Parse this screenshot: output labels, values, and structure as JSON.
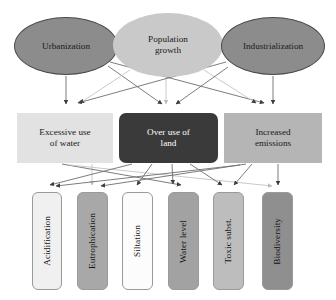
{
  "diagram": {
    "type": "causal-flow-diagram",
    "title": "",
    "rows": {
      "drivers_label": "Drivers",
      "pressures_label": "Pressures",
      "impacts_label": "Impacts"
    },
    "drivers": [
      {
        "id": "urbanization",
        "label": "Urbanization",
        "shape": "ellipse",
        "fill": "#8c8c8c",
        "stroke": "#4a4a4a",
        "x": 14,
        "y": 17,
        "w": 104,
        "h": 58
      },
      {
        "id": "population-growth",
        "label": "Population growth",
        "label_line1": "Population",
        "label_line2": "growth",
        "shape": "ellipse",
        "fill": "#c9c9c9",
        "stroke": "none",
        "x": 113,
        "y": 13,
        "w": 110,
        "h": 64
      },
      {
        "id": "industrialization",
        "label": "Industrialization",
        "shape": "ellipse",
        "fill": "#8c8c8c",
        "stroke": "#4a4a4a",
        "x": 221,
        "y": 17,
        "w": 104,
        "h": 58
      }
    ],
    "pressures": [
      {
        "id": "excessive-use-of-water",
        "label": "Excessive use of water",
        "label_line1": "Excessive use",
        "label_line2": "of water",
        "shape": "rect",
        "fill": "#e2e2e2",
        "x": 17,
        "y": 113,
        "w": 96,
        "h": 50
      },
      {
        "id": "over-use-of-land",
        "label": "Over use of land",
        "label_line1": "Over use of",
        "label_line2": "land",
        "shape": "rounded-rect",
        "fill": "#3a3a3a",
        "text_color": "#ffffff",
        "x": 119,
        "y": 113,
        "w": 99,
        "h": 50
      },
      {
        "id": "increased-emissions",
        "label": "Increased emissions",
        "label_line1": "Increased",
        "label_line2": "emissions",
        "shape": "rect",
        "fill": "#b5b5b5",
        "x": 224,
        "y": 113,
        "w": 98,
        "h": 50
      }
    ],
    "impacts": [
      {
        "id": "acidification",
        "label": "Acidification",
        "fill": "#f0f0f0",
        "theme": "t-lightest",
        "x": 32,
        "y": 192,
        "w": 30,
        "h": 98
      },
      {
        "id": "eutrophication",
        "label": "Eutrophication",
        "fill": "#a8a8a8",
        "theme": "t-mid",
        "x": 77,
        "y": 192,
        "w": 31,
        "h": 98
      },
      {
        "id": "siltation",
        "label": "Siltation",
        "fill": "#fcfcfc",
        "theme": "t-white",
        "x": 122,
        "y": 192,
        "w": 31,
        "h": 98
      },
      {
        "id": "water-level",
        "label": "Water level",
        "fill": "#a2a2a2",
        "theme": "t-mid2",
        "x": 168,
        "y": 192,
        "w": 31,
        "h": 98
      },
      {
        "id": "toxic-subst",
        "label": "Toxic subst.",
        "fill": "#bdbdbd",
        "theme": "t-light",
        "x": 213,
        "y": 192,
        "w": 31,
        "h": 98
      },
      {
        "id": "biodiversity",
        "label": "Biodiversity",
        "fill": "#8f8f8f",
        "theme": "t-dark",
        "x": 262,
        "y": 192,
        "w": 31,
        "h": 98
      }
    ],
    "edges": [
      {
        "from": "urbanization",
        "to": "excessive-use-of-water"
      },
      {
        "from": "urbanization",
        "to": "over-use-of-land"
      },
      {
        "from": "urbanization",
        "to": "increased-emissions"
      },
      {
        "from": "population-growth",
        "to": "excessive-use-of-water"
      },
      {
        "from": "population-growth",
        "to": "over-use-of-land"
      },
      {
        "from": "population-growth",
        "to": "increased-emissions"
      },
      {
        "from": "industrialization",
        "to": "excessive-use-of-water"
      },
      {
        "from": "industrialization",
        "to": "over-use-of-land"
      },
      {
        "from": "industrialization",
        "to": "increased-emissions"
      },
      {
        "from": "excessive-use-of-water",
        "to": "eutrophication"
      },
      {
        "from": "excessive-use-of-water",
        "to": "water-level"
      },
      {
        "from": "excessive-use-of-water",
        "to": "biodiversity"
      },
      {
        "from": "over-use-of-land",
        "to": "acidification"
      },
      {
        "from": "over-use-of-land",
        "to": "siltation"
      },
      {
        "from": "over-use-of-land",
        "to": "water-level"
      },
      {
        "from": "over-use-of-land",
        "to": "toxic-subst"
      },
      {
        "from": "increased-emissions",
        "to": "acidification"
      },
      {
        "from": "increased-emissions",
        "to": "eutrophication"
      },
      {
        "from": "increased-emissions",
        "to": "toxic-subst"
      },
      {
        "from": "increased-emissions",
        "to": "biodiversity"
      }
    ]
  },
  "colors": {
    "edge_dark": "#6e6e6e",
    "edge_light": "#c4c4c4",
    "arrow_dark": "#3d3d3d",
    "arrow_light": "#bdbdbd",
    "background": "#ffffff"
  }
}
